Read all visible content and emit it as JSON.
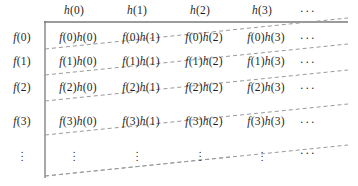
{
  "figure": {
    "axis_color": "#7a7a7a",
    "diagonal_color": "#8c8c8c",
    "text_color": "#1f1f1f",
    "background": "#ffffff"
  },
  "column_headers": [
    {
      "label": "h(0)",
      "x": 74
    },
    {
      "label": "h(1)",
      "x": 137
    },
    {
      "label": "h(2)",
      "x": 200
    },
    {
      "label": "h(3)",
      "x": 262
    },
    {
      "label": "⋯",
      "x": 308
    }
  ],
  "row_headers": [
    {
      "label": "f(0)",
      "y": 38
    },
    {
      "label": "f(1)",
      "y": 62
    },
    {
      "label": "f(2)",
      "y": 88
    },
    {
      "label": "f(3)",
      "y": 122
    },
    {
      "label": "⋮",
      "y": 153
    }
  ],
  "cells": [
    {
      "text": "f(0)h(0)",
      "x": 78,
      "y": 38
    },
    {
      "text": "f(0)h(1)",
      "x": 141,
      "y": 38
    },
    {
      "text": "f(0)h(2)",
      "x": 204,
      "y": 38
    },
    {
      "text": "f(0)h(3)",
      "x": 266,
      "y": 38
    },
    {
      "text": "⋯",
      "x": 308,
      "y": 38
    },
    {
      "text": "f(1)h(0)",
      "x": 78,
      "y": 62
    },
    {
      "text": "f(1)h(1)",
      "x": 141,
      "y": 62
    },
    {
      "text": "f(1)h(2)",
      "x": 204,
      "y": 62
    },
    {
      "text": "f(1)h(3)",
      "x": 266,
      "y": 62
    },
    {
      "text": "⋯",
      "x": 308,
      "y": 62
    },
    {
      "text": "f(2)h(0)",
      "x": 78,
      "y": 88
    },
    {
      "text": "f(2)h(1)",
      "x": 141,
      "y": 88
    },
    {
      "text": "f(2)h(2)",
      "x": 204,
      "y": 88
    },
    {
      "text": "f(2)h(3)",
      "x": 266,
      "y": 88
    },
    {
      "text": "⋯",
      "x": 308,
      "y": 88
    },
    {
      "text": "f(3)h(0)",
      "x": 78,
      "y": 122
    },
    {
      "text": "f(3)h(1)",
      "x": 141,
      "y": 122
    },
    {
      "text": "f(3)h(2)",
      "x": 204,
      "y": 122
    },
    {
      "text": "f(3)h(3)",
      "x": 266,
      "y": 122
    },
    {
      "text": "⋯",
      "x": 308,
      "y": 122
    },
    {
      "text": "⋮",
      "x": 74,
      "y": 153
    },
    {
      "text": "⋮",
      "x": 137,
      "y": 153
    },
    {
      "text": "⋮",
      "x": 200,
      "y": 153
    },
    {
      "text": "⋮",
      "x": 262,
      "y": 153
    },
    {
      "text": "⋯",
      "x": 308,
      "y": 153
    }
  ],
  "axes": {
    "horizontal": {
      "x1": 44,
      "y1": 22,
      "x2": 348,
      "y2": 22
    },
    "vertical": {
      "x1": 45,
      "y1": 21,
      "x2": 45,
      "y2": 178
    }
  },
  "diagonals": [
    {
      "x1": 45,
      "y1": 49,
      "x2": 348,
      "y2": 18
    },
    {
      "x1": 45,
      "y1": 75,
      "x2": 348,
      "y2": 44
    },
    {
      "x1": 45,
      "y1": 101,
      "x2": 348,
      "y2": 70
    },
    {
      "x1": 45,
      "y1": 135,
      "x2": 348,
      "y2": 104
    },
    {
      "x1": 45,
      "y1": 176,
      "x2": 230,
      "y2": 157
    },
    {
      "x1": 45,
      "y1": 176,
      "x2": 348,
      "y2": 145
    }
  ]
}
